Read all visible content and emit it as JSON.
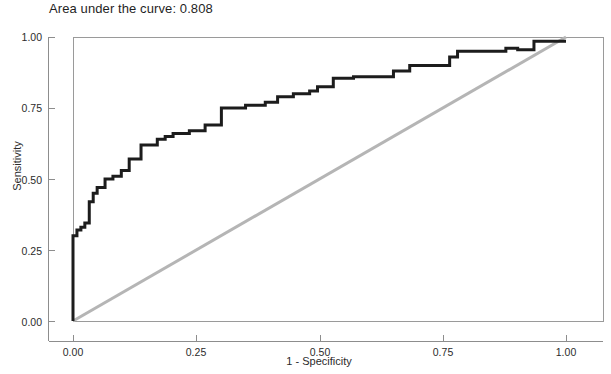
{
  "chart_data": {
    "type": "line",
    "title": "Area under the curve: 0.808",
    "xlabel": "1 - Specificity",
    "ylabel": "Sensitivity",
    "xlim": [
      0,
      1
    ],
    "ylim": [
      0,
      1
    ],
    "grid": false,
    "legend": "none",
    "auc": "0.808",
    "xticks": [
      "0.00",
      "0.25",
      "0.50",
      "0.75",
      "1.00"
    ],
    "xtick_values": [
      0,
      0.25,
      0.5,
      0.75,
      1
    ],
    "yticks": [
      "0.00",
      "0.25",
      "0.50",
      "0.75",
      "1.00"
    ],
    "ytick_values": [
      0,
      0.25,
      0.5,
      0.75,
      1
    ],
    "series": [
      {
        "name": "ROC curve",
        "color": "#1c1c1c",
        "width": 3,
        "x": [
          0.0,
          0.0,
          0.008,
          0.008,
          0.016,
          0.016,
          0.024,
          0.024,
          0.033,
          0.033,
          0.041,
          0.041,
          0.049,
          0.049,
          0.065,
          0.065,
          0.081,
          0.081,
          0.098,
          0.098,
          0.114,
          0.114,
          0.138,
          0.138,
          0.171,
          0.171,
          0.187,
          0.187,
          0.203,
          0.203,
          0.236,
          0.236,
          0.268,
          0.268,
          0.301,
          0.301,
          0.35,
          0.35,
          0.39,
          0.39,
          0.415,
          0.415,
          0.447,
          0.447,
          0.48,
          0.48,
          0.496,
          0.496,
          0.528,
          0.528,
          0.569,
          0.569,
          0.65,
          0.65,
          0.683,
          0.683,
          0.764,
          0.764,
          0.78,
          0.78,
          0.878,
          0.878,
          0.902,
          0.902,
          0.935,
          0.935,
          1.0
        ],
        "y": [
          0.0,
          0.3,
          0.3,
          0.32,
          0.32,
          0.33,
          0.33,
          0.345,
          0.345,
          0.42,
          0.42,
          0.45,
          0.45,
          0.47,
          0.47,
          0.5,
          0.5,
          0.51,
          0.51,
          0.53,
          0.53,
          0.57,
          0.57,
          0.62,
          0.62,
          0.64,
          0.64,
          0.65,
          0.65,
          0.66,
          0.66,
          0.67,
          0.67,
          0.69,
          0.69,
          0.75,
          0.75,
          0.76,
          0.76,
          0.77,
          0.77,
          0.79,
          0.79,
          0.8,
          0.8,
          0.81,
          0.81,
          0.825,
          0.825,
          0.855,
          0.855,
          0.86,
          0.86,
          0.88,
          0.88,
          0.9,
          0.9,
          0.93,
          0.93,
          0.95,
          0.95,
          0.96,
          0.96,
          0.955,
          0.955,
          0.985,
          0.985
        ]
      },
      {
        "name": "Reference line",
        "color": "#b5b5b5",
        "width": 3,
        "x": [
          0,
          1
        ],
        "y": [
          0,
          1
        ]
      }
    ]
  },
  "axes": {
    "title": "Area under the curve: 0.808",
    "x_title": "1 - Specificity",
    "y_title": "Sensitivity",
    "x_tick_labels": [
      "0.00",
      "0.25",
      "0.50",
      "0.75",
      "1.00"
    ],
    "y_tick_labels": [
      "0.00",
      "0.25",
      "0.50",
      "0.75",
      "1.00"
    ]
  },
  "colors": {
    "curve": "#1c1c1c",
    "reference": "#b5b5b5",
    "frame": "#9a9a9a",
    "axis": "#8d8d8d",
    "text": "#2b2b2b",
    "background": "#ffffff"
  }
}
